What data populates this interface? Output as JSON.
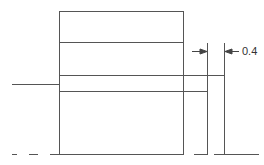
{
  "diagram": {
    "type": "technical-drawing",
    "background": "#ffffff",
    "stroke_color": "#555555",
    "dimension": {
      "label": "0.4",
      "arrows": [
        "right-pointing",
        "left-pointing"
      ]
    },
    "shapes": {
      "main_box": {
        "x": 59,
        "y": 11,
        "width": 124,
        "height": 143
      },
      "inner_divider_y": 42,
      "band": {
        "x1": 59,
        "y_top": 75,
        "y_bottom": 91,
        "x_end_bottom": 207,
        "x_end_top": 224
      },
      "left_lead_line": {
        "x1": 12,
        "x2": 59,
        "y": 84
      },
      "verticals": [
        207,
        224
      ],
      "baseline_y": 154
    }
  }
}
